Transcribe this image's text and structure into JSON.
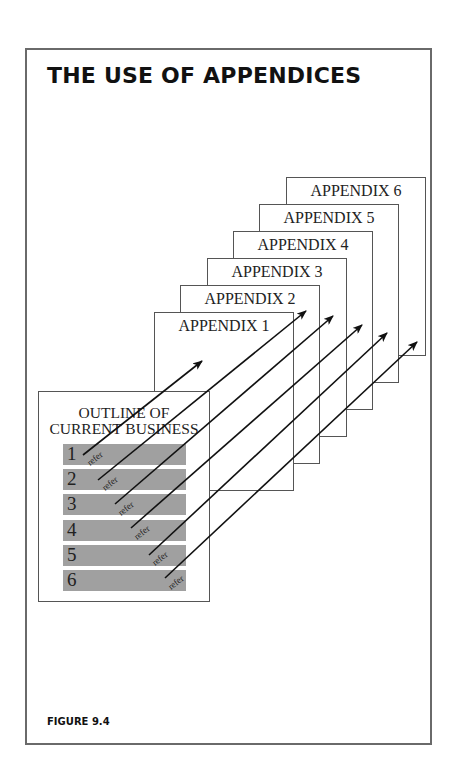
{
  "title": "THE USE OF APPENDICES",
  "figure_label": "FIGURE 9.4",
  "appendices": [
    {
      "label": "APPENDIX 1",
      "x": 154,
      "y": 312
    },
    {
      "label": "APPENDIX 2",
      "x": 180,
      "y": 285
    },
    {
      "label": "APPENDIX 3",
      "x": 207,
      "y": 258
    },
    {
      "label": "APPENDIX 4",
      "x": 233,
      "y": 231
    },
    {
      "label": "APPENDIX 5",
      "x": 259,
      "y": 204
    },
    {
      "label": "APPENDIX 6",
      "x": 286,
      "y": 177
    }
  ],
  "outline": {
    "title_line1": "OUTLINE OF",
    "title_line2": "CURRENT BUSINESS",
    "items": [
      {
        "number": "1",
        "refer": "refer",
        "top": 52
      },
      {
        "number": "2",
        "refer": "refer",
        "top": 77
      },
      {
        "number": "3",
        "refer": "refer",
        "top": 102
      },
      {
        "number": "4",
        "refer": "refer",
        "top": 128
      },
      {
        "number": "5",
        "refer": "refer",
        "top": 153
      },
      {
        "number": "6",
        "refer": "refer",
        "top": 178
      }
    ]
  },
  "arrows": [
    {
      "from": [
        83,
        455
      ],
      "to": [
        202,
        361
      ],
      "label_at": [
        90,
        466
      ]
    },
    {
      "from": [
        98,
        480
      ],
      "to": [
        306,
        311
      ],
      "label_at": [
        105,
        491
      ]
    },
    {
      "from": [
        115,
        504
      ],
      "to": [
        333,
        316
      ],
      "label_at": [
        121,
        516
      ]
    },
    {
      "from": [
        131,
        528
      ],
      "to": [
        362,
        325
      ],
      "label_at": [
        137,
        540
      ]
    },
    {
      "from": [
        149,
        555
      ],
      "to": [
        387,
        333
      ],
      "label_at": [
        155,
        566
      ]
    },
    {
      "from": [
        165,
        578
      ],
      "to": [
        417,
        342
      ],
      "label_at": [
        171,
        590
      ]
    }
  ],
  "colors": {
    "frame": "#6a6a6a",
    "box_border": "#555555",
    "bar_fill": "#a0a0a0",
    "arrow": "#111111",
    "text": "#222222"
  }
}
